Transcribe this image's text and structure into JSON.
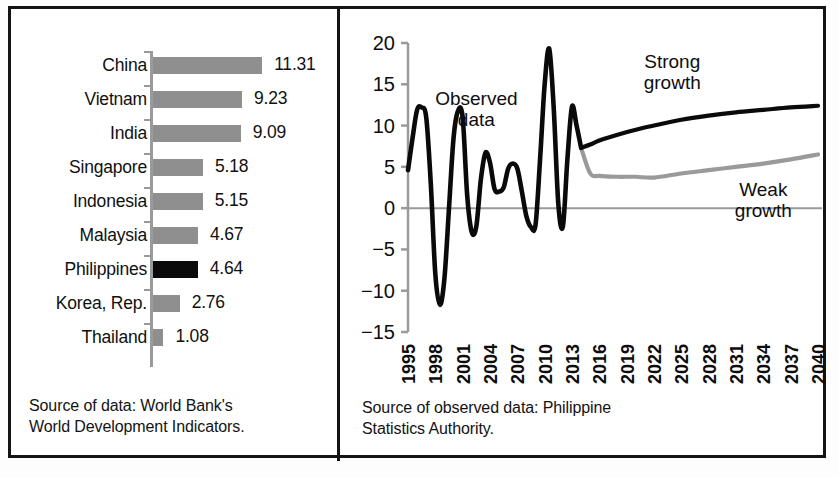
{
  "figure": {
    "panels": [
      "bar-chart",
      "line-chart"
    ]
  },
  "left_panel": {
    "caption_line1": "Source of data: World Bank's",
    "caption_line2": "World Development Indicators.",
    "highlight_country": "Philippines",
    "bar_color": "#8f8f8f",
    "highlight_color": "#0a0a0a"
  },
  "right_panel": {
    "caption_line1": "Source of observed data:  Philippine",
    "caption_line2": "Statistics Authority.",
    "observed_label_line1": "Observed",
    "observed_label_line2": "data",
    "strong_label_line1": "Strong",
    "strong_label_line2": "growth",
    "weak_label_line1": "Weak",
    "weak_label_line2": "growth",
    "strong_color": "#0a0a0a",
    "weak_color": "#9a9a9a"
  },
  "chart_data": [
    {
      "type": "bar",
      "orientation": "horizontal",
      "title": "",
      "xlabel": "",
      "ylabel": "",
      "categories": [
        "China",
        "Vietnam",
        "India",
        "Singapore",
        "Indonesia",
        "Malaysia",
        "Philippines",
        "Korea, Rep.",
        "Thailand"
      ],
      "values": [
        11.31,
        9.23,
        9.09,
        5.18,
        5.15,
        4.67,
        4.64,
        2.76,
        1.08
      ],
      "value_labels": [
        "11.31",
        "9.23",
        "9.09",
        "5.18",
        "5.15",
        "4.67",
        "4.64",
        "2.76",
        "1.08"
      ],
      "highlight_index": 6,
      "xlim": [
        0,
        11.31
      ],
      "grid": false,
      "legend": "none"
    },
    {
      "type": "line",
      "title": "",
      "xlabel": "",
      "ylabel": "",
      "ylim": [
        -15,
        20
      ],
      "yticks": [
        20,
        15,
        10,
        5,
        0,
        -5,
        -10,
        -15
      ],
      "ytick_labels": [
        "20",
        "15",
        "10",
        "5",
        "0",
        "−5",
        "−10",
        "−15"
      ],
      "xlim": [
        1995,
        2040
      ],
      "xticks": [
        1995,
        1998,
        2001,
        2004,
        2007,
        2010,
        2013,
        2016,
        2019,
        2022,
        2025,
        2028,
        2031,
        2034,
        2037,
        2040
      ],
      "xtick_labels": [
        "1995",
        "1998",
        "2001",
        "2004",
        "2007",
        "2010",
        "2013",
        "2016",
        "2019",
        "2022",
        "2025",
        "2028",
        "2031",
        "2034",
        "2037",
        "2040"
      ],
      "grid": false,
      "legend": "none",
      "zero_line": 0,
      "annotations": [
        {
          "text": "Observed data",
          "x": 2002.5,
          "y": 12.5
        },
        {
          "text": "Strong growth",
          "x": 2024,
          "y": 17
        },
        {
          "text": "Weak growth",
          "x": 2034,
          "y": 1.5
        }
      ],
      "series": [
        {
          "name": "Observed data",
          "color": "#0a0a0a",
          "x": [
            1995,
            1995.5,
            1996,
            1996.5,
            1997,
            1997.5,
            1998,
            1998.5,
            1999,
            1999.5,
            2000,
            2000.5,
            2001,
            2001.5,
            2002,
            2002.5,
            2003,
            2003.5,
            2004,
            2004.5,
            2005,
            2005.5,
            2006,
            2006.5,
            2007,
            2007.5,
            2008,
            2008.5,
            2009,
            2009.5,
            2010,
            2010.5,
            2011,
            2011.5,
            2012,
            2012.5,
            2013,
            2013.5,
            2014
          ],
          "values": [
            4.6,
            8.5,
            11.9,
            12.2,
            11.0,
            3.0,
            -8.0,
            -11.7,
            -8.5,
            0.0,
            8.5,
            11.8,
            11.0,
            1.5,
            -2.9,
            -2.2,
            3.5,
            6.7,
            5.5,
            2.3,
            2.0,
            2.5,
            4.8,
            5.4,
            4.8,
            2.0,
            -1.0,
            -2.3,
            -2.0,
            6.0,
            15.0,
            19.3,
            12.0,
            0.5,
            -2.2,
            6.0,
            12.3,
            10.0,
            7.3
          ]
        },
        {
          "name": "Strong growth",
          "color": "#0a0a0a",
          "x": [
            2014,
            2015,
            2016,
            2018,
            2020,
            2022,
            2025,
            2028,
            2031,
            2034,
            2037,
            2040
          ],
          "values": [
            7.3,
            7.7,
            8.2,
            8.9,
            9.5,
            10.0,
            10.7,
            11.2,
            11.6,
            11.9,
            12.2,
            12.4
          ]
        },
        {
          "name": "Weak growth",
          "color": "#9a9a9a",
          "x": [
            2014,
            2015,
            2016,
            2018,
            2020,
            2022,
            2025,
            2028,
            2031,
            2034,
            2037,
            2040
          ],
          "values": [
            7.3,
            4.2,
            3.9,
            3.8,
            3.8,
            3.7,
            4.2,
            4.6,
            5.0,
            5.4,
            5.9,
            6.5
          ]
        }
      ]
    }
  ]
}
